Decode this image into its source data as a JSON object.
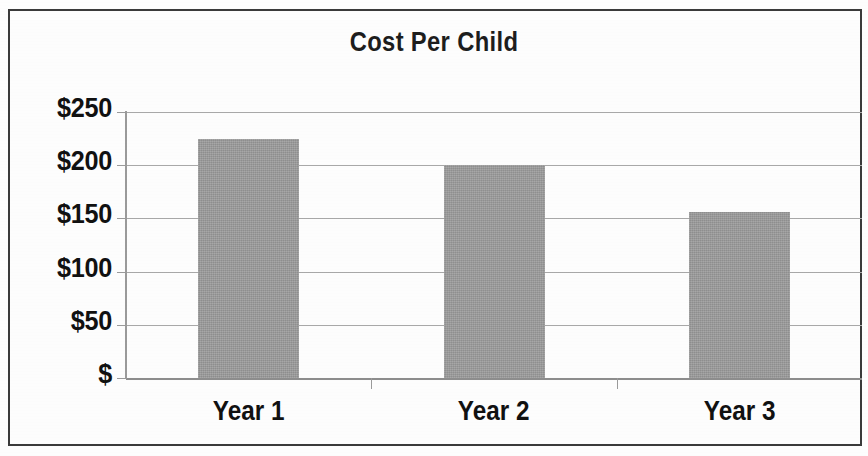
{
  "chart_data": {
    "type": "bar",
    "title": "Cost Per Child",
    "xlabel": "",
    "ylabel": "",
    "categories": [
      "Year 1",
      "Year 2",
      "Year 3"
    ],
    "values": [
      225,
      200,
      156
    ],
    "ylim": [
      0,
      250
    ],
    "ytick_values": [
      0,
      50,
      100,
      150,
      200,
      250
    ],
    "ytick_labels": [
      "$",
      "$50",
      "$100",
      "$150",
      "$200",
      "$250"
    ],
    "grid": true,
    "legend": null,
    "bar_color": "#9c9c9c",
    "gridline_color": "#a8a8a8",
    "axis_color": "#9a9a9a",
    "text_color": "#111111",
    "background_color": "#ffffff",
    "border_color": "#3a3a3a"
  }
}
